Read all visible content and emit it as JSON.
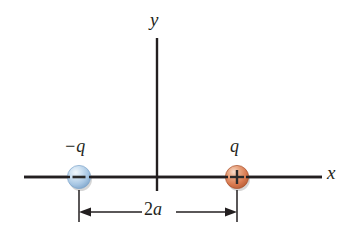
{
  "figure": {
    "name": "electric-dipole-diagram",
    "background_color": "#ffffff",
    "axis_color": "#231f20",
    "labels": {
      "y_axis": "y",
      "x_axis": "x",
      "negative_charge": "−q",
      "positive_charge": "q",
      "separation_number": "2",
      "separation_symbol": "a",
      "separation_full": "2a"
    },
    "charges": [
      {
        "id": "negative-charge",
        "label": "−q",
        "sign": "−",
        "sign_glyph": "minus",
        "color": "#a9c8e4",
        "edge_color": "#6d93bb",
        "highlight_color": "#e8f1f9",
        "cx": 79,
        "cy": 177,
        "r": 12
      },
      {
        "id": "positive-charge",
        "label": "q",
        "sign": "+",
        "sign_glyph": "plus",
        "color": "#d9794f",
        "edge_color": "#a8522e",
        "highlight_color": "#f6d9c6",
        "cx": 237,
        "cy": 177,
        "r": 12
      }
    ],
    "axes": {
      "x_axis": {
        "x1": 24,
        "y1": 177,
        "x2": 322,
        "y2": 177
      },
      "y_axis": {
        "x1": 157,
        "y1": 38,
        "x2": 157,
        "y2": 191
      }
    },
    "dimension": {
      "label": "2a",
      "value_left_x": 79,
      "value_right_x": 237,
      "line_y": 212,
      "tick_top_y": 190,
      "tick_bottom_y": 222,
      "arrow_style": "double-headed"
    },
    "colors": {
      "ink": "#231f20",
      "negative": "#a9c8e4",
      "positive": "#d9794f",
      "paper": "#ffffff"
    }
  }
}
